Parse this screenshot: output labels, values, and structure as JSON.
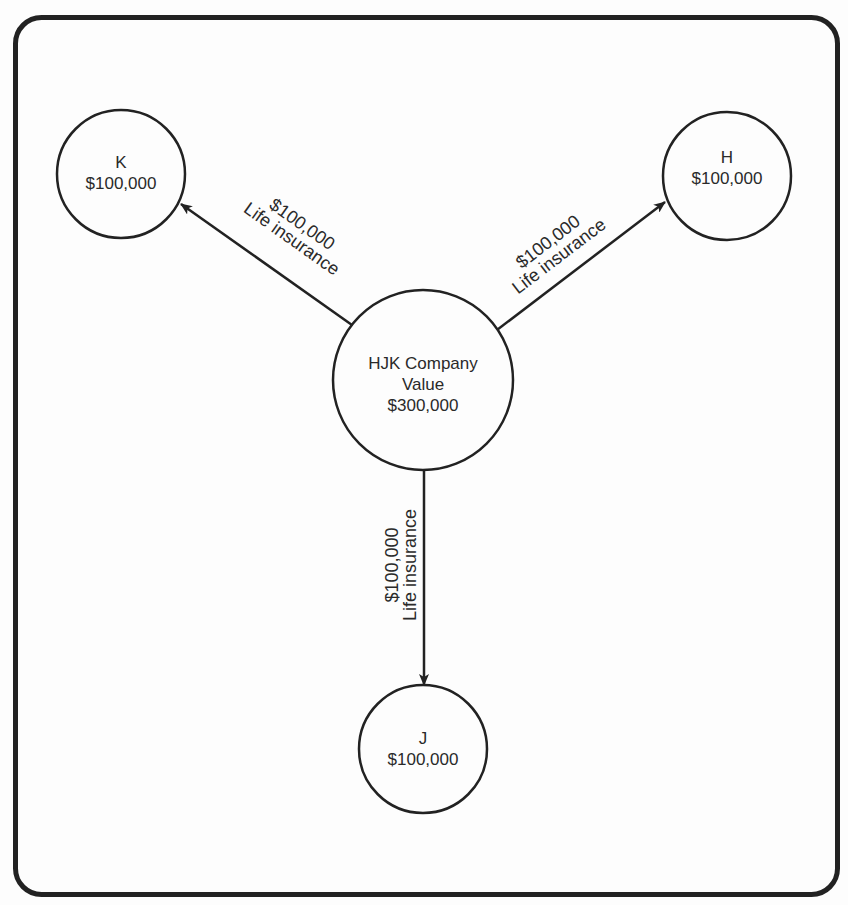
{
  "diagram": {
    "center": {
      "id": "company",
      "lines": [
        "HJK Company",
        "Value",
        "$300,000"
      ]
    },
    "nodes": [
      {
        "id": "K",
        "lines": [
          "K",
          "$100,000"
        ]
      },
      {
        "id": "H",
        "lines": [
          "H",
          "$100,000"
        ]
      },
      {
        "id": "J",
        "lines": [
          "J",
          "$100,000"
        ]
      }
    ],
    "edges": [
      {
        "from": "company",
        "to": "K",
        "lines": [
          "$100,000",
          "Life insurance"
        ]
      },
      {
        "from": "company",
        "to": "H",
        "lines": [
          "$100,000",
          "Life insurance"
        ]
      },
      {
        "from": "company",
        "to": "J",
        "lines": [
          "$100,000",
          "Life insurance"
        ]
      }
    ],
    "colors": {
      "stroke": "#222222",
      "background": "#fdfdfd"
    }
  }
}
